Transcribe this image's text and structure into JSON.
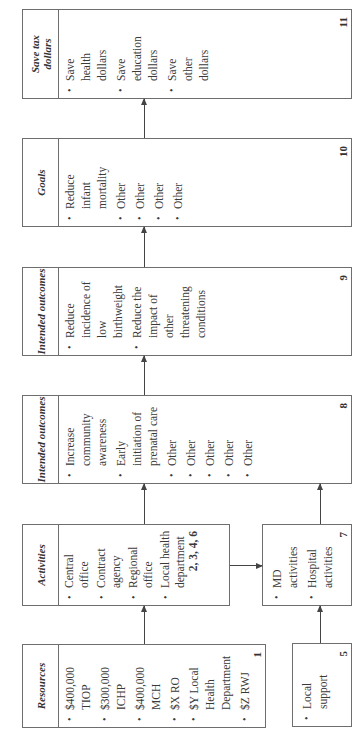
{
  "diagram": {
    "boxes": {
      "resources": {
        "title": "Resources",
        "number": "1",
        "items": [
          "$400,000 TIOP",
          "$300,000 ICHP",
          "$400,000 MCH",
          "$X RO",
          "$Y Local Health Department",
          "$Z RWJ"
        ]
      },
      "local_support": {
        "title": "",
        "number": "5",
        "items": [
          "Local support"
        ]
      },
      "activities": {
        "title": "Activities",
        "number": "2, 3, 4, 6",
        "items": [
          "Central office",
          "Contract agency",
          "Regional office",
          "Local health department"
        ]
      },
      "md_hospital": {
        "number": "7",
        "items": [
          "MD activities",
          "Hospital activities"
        ]
      },
      "intended_outcomes_1": {
        "title": "Intended outcomes",
        "number": "8",
        "items": [
          "Increase community awareness",
          "Early initiation of prenatal care",
          "Other",
          "Other",
          "Other",
          "Other",
          "Other"
        ]
      },
      "intended_outcomes_2": {
        "title": "Intended outcomes",
        "number": "9",
        "items": [
          "Reduce incidence of low birthweight",
          "Reduce the impact of other threatening conditions"
        ]
      },
      "goals": {
        "title": "Goals",
        "number": "10",
        "items": [
          "Reduce infant mortality",
          "Other",
          "Other",
          "Other",
          "Other"
        ]
      },
      "save_tax_dollars": {
        "title": "Save tax dollars",
        "number": "11",
        "items": [
          "Save health dollars",
          "Save education dollars",
          "Save other dollars"
        ]
      }
    },
    "connections": [
      {
        "from": "resources",
        "to": "activities"
      },
      {
        "from": "local_support",
        "to": "md_hospital"
      },
      {
        "from": "activities",
        "to": "md_hospital"
      },
      {
        "from": "activities",
        "to": "intended_outcomes_1"
      },
      {
        "from": "md_hospital",
        "to": "intended_outcomes_1"
      },
      {
        "from": "intended_outcomes_1",
        "to": "intended_outcomes_2"
      },
      {
        "from": "intended_outcomes_2",
        "to": "goals"
      },
      {
        "from": "goals",
        "to": "save_tax_dollars"
      }
    ],
    "orientation": "rotated 90deg counter-clockwise"
  }
}
